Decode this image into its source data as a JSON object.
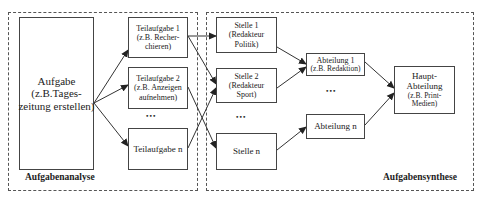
{
  "regions": {
    "analysis": {
      "label": "Aufgabenanalyse"
    },
    "synthesis": {
      "label": "Aufgabensynthese"
    }
  },
  "nodes": {
    "aufgabe": {
      "lines": [
        "Aufgabe",
        "(z.B.Tages-",
        "zeitung erstellen)"
      ]
    },
    "teilaufgabe1": {
      "lines": [
        "Teilaufgabe 1",
        "(z.B. Recher-",
        "chieren)"
      ]
    },
    "teilaufgabe2": {
      "lines": [
        "Teilaufgabe 2",
        "(z.B. Anzeigen",
        "aufnehmen)"
      ]
    },
    "teilaufgaben": {
      "lines": [
        "Teilaufgabe n"
      ]
    },
    "stelle1": {
      "lines": [
        "Stelle 1",
        "(Redakteur",
        "Politik)"
      ]
    },
    "stelle2": {
      "lines": [
        "Stelle 2",
        "(Redakteur",
        "Sport)"
      ]
    },
    "stellen": {
      "lines": [
        "Stelle n"
      ]
    },
    "abteilung1": {
      "lines": [
        "Abteilung 1",
        "(z.B. Redaktion)"
      ]
    },
    "abteilungn": {
      "lines": [
        "Abteilung n"
      ]
    },
    "hauptabteilung": {
      "lines": [
        "Haupt-",
        "Abteilung",
        "(z.B. Print-",
        "Medien)"
      ]
    }
  },
  "ellipses": {
    "teilaufgaben": "•••",
    "stellen": "•••",
    "abteilungen": "•••"
  },
  "edges": [
    {
      "from": "aufgabe",
      "to": "teilaufgabe1"
    },
    {
      "from": "aufgabe",
      "to": "teilaufgabe2"
    },
    {
      "from": "aufgabe",
      "to": "teilaufgaben"
    },
    {
      "from": "teilaufgabe1",
      "to": "stelle1"
    },
    {
      "from": "teilaufgabe1",
      "to": "stelle2"
    },
    {
      "from": "teilaufgabe2",
      "to": "stellen"
    },
    {
      "from": "teilaufgaben",
      "to": "stelle2"
    },
    {
      "from": "stelle1",
      "to": "abteilung1"
    },
    {
      "from": "stelle2",
      "to": "abteilung1"
    },
    {
      "from": "stellen",
      "to": "abteilungn"
    },
    {
      "from": "abteilung1",
      "to": "hauptabteilung"
    },
    {
      "from": "abteilungn",
      "to": "hauptabteilung"
    }
  ]
}
